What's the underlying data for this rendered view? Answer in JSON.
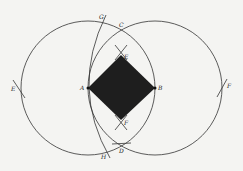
{
  "diagram": {
    "title": "",
    "colors": {
      "background": "#f4f4f2",
      "stroke": "#333333",
      "fill": "#1e1e1e"
    },
    "points": {
      "A": {
        "label": "A",
        "x": 88,
        "y": 88
      },
      "B": {
        "label": "B",
        "x": 155,
        "y": 88
      },
      "C": {
        "label": "C",
        "x": 121,
        "y": 30
      },
      "D": {
        "label": "D",
        "x": 121,
        "y": 145
      },
      "E_top": {
        "label": "E",
        "x": 121,
        "y": 55
      },
      "F_bottom": {
        "label": "F",
        "x": 121,
        "y": 120
      },
      "E_left": {
        "label": "E",
        "x": 18,
        "y": 88
      },
      "F_right": {
        "label": "F",
        "x": 223,
        "y": 87
      },
      "G": {
        "label": "G",
        "x": 103,
        "y": 20
      },
      "H": {
        "label": "H",
        "x": 104,
        "y": 155
      }
    },
    "circles": [
      {
        "name": "circle-center-A",
        "cx": 88,
        "cy": 88,
        "r": 67
      },
      {
        "name": "circle-center-B",
        "cx": 155,
        "cy": 88,
        "r": 67
      }
    ],
    "square": {
      "name": "filled-square-AEBF",
      "vertices": [
        "A",
        "E_top",
        "B",
        "F_bottom"
      ]
    }
  }
}
